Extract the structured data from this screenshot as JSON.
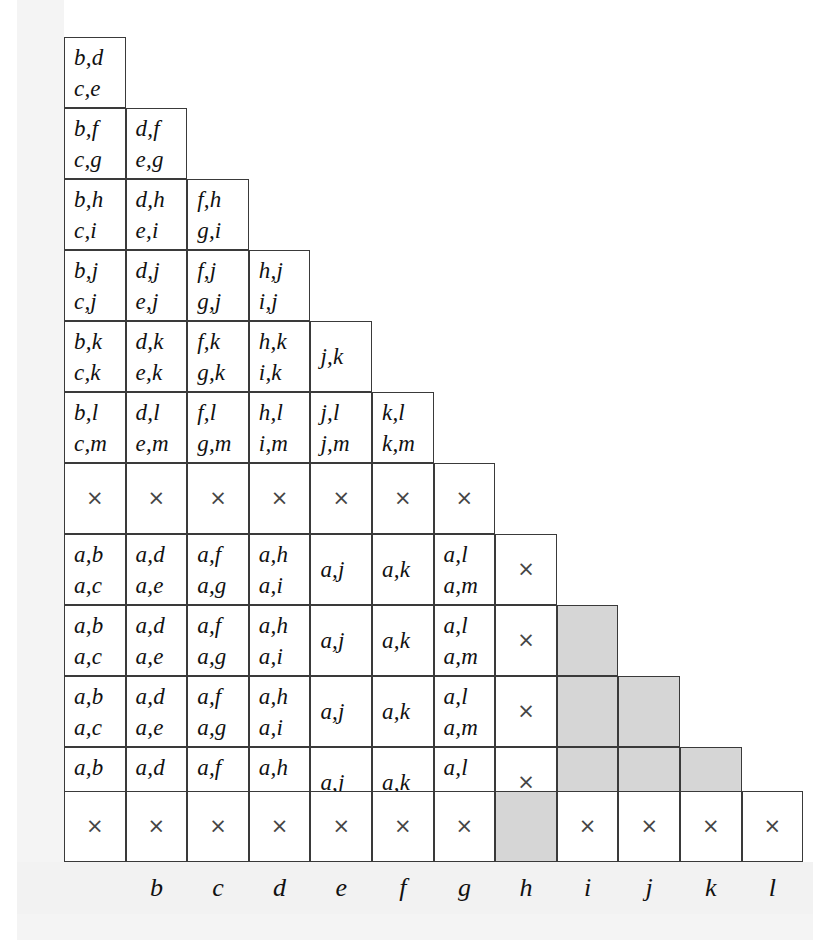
{
  "figure": {
    "grid_rows": 13,
    "grid_cols": 12,
    "cross_glyph": "×",
    "colors": {
      "cell_background": "#ffffff",
      "shaded_cell": "#d6d6d6",
      "grid_line": "#3a3a3a",
      "text": "#111111",
      "page_band": "#f2f2f2"
    }
  },
  "axis": {
    "name": "column-axis",
    "labels": [
      "",
      "b",
      "c",
      "d",
      "e",
      "f",
      "g",
      "h",
      "i",
      "j",
      "k",
      "l"
    ]
  },
  "chart_data": {
    "type": "table",
    "xlabel": "",
    "ylabel": "",
    "categories": [
      "",
      "b",
      "c",
      "d",
      "e",
      "f",
      "g",
      "h",
      "i",
      "j",
      "k",
      "l"
    ],
    "grid": [
      {
        "row": 1,
        "cells": [
          {
            "col": 1,
            "lines": [
              "b,d",
              "c,e"
            ],
            "shaded": false,
            "cross": false
          }
        ]
      },
      {
        "row": 2,
        "cells": [
          {
            "col": 1,
            "lines": [
              "b,f",
              "c,g"
            ],
            "shaded": false,
            "cross": false
          },
          {
            "col": 2,
            "lines": [
              "d,f",
              "e,g"
            ],
            "shaded": false,
            "cross": false
          }
        ]
      },
      {
        "row": 3,
        "cells": [
          {
            "col": 1,
            "lines": [
              "b,h",
              "c,i"
            ],
            "shaded": false,
            "cross": false
          },
          {
            "col": 2,
            "lines": [
              "d,h",
              "e,i"
            ],
            "shaded": false,
            "cross": false
          },
          {
            "col": 3,
            "lines": [
              "f,h",
              "g,i"
            ],
            "shaded": false,
            "cross": false
          }
        ]
      },
      {
        "row": 4,
        "cells": [
          {
            "col": 1,
            "lines": [
              "b,j",
              "c,j"
            ],
            "shaded": false,
            "cross": false
          },
          {
            "col": 2,
            "lines": [
              "d,j",
              "e,j"
            ],
            "shaded": false,
            "cross": false
          },
          {
            "col": 3,
            "lines": [
              "f,j",
              "g,j"
            ],
            "shaded": false,
            "cross": false
          },
          {
            "col": 4,
            "lines": [
              "h,j",
              "i,j"
            ],
            "shaded": false,
            "cross": false
          }
        ]
      },
      {
        "row": 5,
        "cells": [
          {
            "col": 1,
            "lines": [
              "b,k",
              "c,k"
            ],
            "shaded": false,
            "cross": false
          },
          {
            "col": 2,
            "lines": [
              "d,k",
              "e,k"
            ],
            "shaded": false,
            "cross": false
          },
          {
            "col": 3,
            "lines": [
              "f,k",
              "g,k"
            ],
            "shaded": false,
            "cross": false
          },
          {
            "col": 4,
            "lines": [
              "h,k",
              "i,k"
            ],
            "shaded": false,
            "cross": false
          },
          {
            "col": 5,
            "lines": [
              "j,k"
            ],
            "shaded": false,
            "cross": false
          }
        ]
      },
      {
        "row": 6,
        "cells": [
          {
            "col": 1,
            "lines": [
              "b,l",
              "c,m"
            ],
            "shaded": false,
            "cross": false
          },
          {
            "col": 2,
            "lines": [
              "d,l",
              "e,m"
            ],
            "shaded": false,
            "cross": false
          },
          {
            "col": 3,
            "lines": [
              "f,l",
              "g,m"
            ],
            "shaded": false,
            "cross": false
          },
          {
            "col": 4,
            "lines": [
              "h,l",
              "i,m"
            ],
            "shaded": false,
            "cross": false
          },
          {
            "col": 5,
            "lines": [
              "j,l",
              "j,m"
            ],
            "shaded": false,
            "cross": false
          },
          {
            "col": 6,
            "lines": [
              "k,l",
              "k,m"
            ],
            "shaded": false,
            "cross": false
          }
        ]
      },
      {
        "row": 7,
        "cells": [
          {
            "col": 1,
            "lines": [],
            "shaded": false,
            "cross": true
          },
          {
            "col": 2,
            "lines": [],
            "shaded": false,
            "cross": true
          },
          {
            "col": 3,
            "lines": [],
            "shaded": false,
            "cross": true
          },
          {
            "col": 4,
            "lines": [],
            "shaded": false,
            "cross": true
          },
          {
            "col": 5,
            "lines": [],
            "shaded": false,
            "cross": true
          },
          {
            "col": 6,
            "lines": [],
            "shaded": false,
            "cross": true
          },
          {
            "col": 7,
            "lines": [],
            "shaded": false,
            "cross": true
          }
        ]
      },
      {
        "row": 8,
        "cells": [
          {
            "col": 1,
            "lines": [
              "a,b",
              "a,c"
            ],
            "shaded": false,
            "cross": false
          },
          {
            "col": 2,
            "lines": [
              "a,d",
              "a,e"
            ],
            "shaded": false,
            "cross": false
          },
          {
            "col": 3,
            "lines": [
              "a,f",
              "a,g"
            ],
            "shaded": false,
            "cross": false
          },
          {
            "col": 4,
            "lines": [
              "a,h",
              "a,i"
            ],
            "shaded": false,
            "cross": false
          },
          {
            "col": 5,
            "lines": [
              "a,j"
            ],
            "shaded": false,
            "cross": false
          },
          {
            "col": 6,
            "lines": [
              "a,k"
            ],
            "shaded": false,
            "cross": false
          },
          {
            "col": 7,
            "lines": [
              "a,l",
              "a,m"
            ],
            "shaded": false,
            "cross": false
          },
          {
            "col": 8,
            "lines": [],
            "shaded": false,
            "cross": true
          }
        ]
      },
      {
        "row": 9,
        "cells": [
          {
            "col": 1,
            "lines": [
              "a,b",
              "a,c"
            ],
            "shaded": false,
            "cross": false
          },
          {
            "col": 2,
            "lines": [
              "a,d",
              "a,e"
            ],
            "shaded": false,
            "cross": false
          },
          {
            "col": 3,
            "lines": [
              "a,f",
              "a,g"
            ],
            "shaded": false,
            "cross": false
          },
          {
            "col": 4,
            "lines": [
              "a,h",
              "a,i"
            ],
            "shaded": false,
            "cross": false
          },
          {
            "col": 5,
            "lines": [
              "a,j"
            ],
            "shaded": false,
            "cross": false
          },
          {
            "col": 6,
            "lines": [
              "a,k"
            ],
            "shaded": false,
            "cross": false
          },
          {
            "col": 7,
            "lines": [
              "a,l",
              "a,m"
            ],
            "shaded": false,
            "cross": false
          },
          {
            "col": 8,
            "lines": [],
            "shaded": false,
            "cross": true
          },
          {
            "col": 9,
            "lines": [],
            "shaded": true,
            "cross": false
          }
        ]
      },
      {
        "row": 10,
        "cells": [
          {
            "col": 1,
            "lines": [
              "a,b",
              "a,c"
            ],
            "shaded": false,
            "cross": false
          },
          {
            "col": 2,
            "lines": [
              "a,d",
              "a,e"
            ],
            "shaded": false,
            "cross": false
          },
          {
            "col": 3,
            "lines": [
              "a,f",
              "a,g"
            ],
            "shaded": false,
            "cross": false
          },
          {
            "col": 4,
            "lines": [
              "a,h",
              "a,i"
            ],
            "shaded": false,
            "cross": false
          },
          {
            "col": 5,
            "lines": [
              "a,j"
            ],
            "shaded": false,
            "cross": false
          },
          {
            "col": 6,
            "lines": [
              "a,k"
            ],
            "shaded": false,
            "cross": false
          },
          {
            "col": 7,
            "lines": [
              "a,l",
              "a,m"
            ],
            "shaded": false,
            "cross": false
          },
          {
            "col": 8,
            "lines": [],
            "shaded": false,
            "cross": true
          },
          {
            "col": 9,
            "lines": [],
            "shaded": true,
            "cross": false
          },
          {
            "col": 10,
            "lines": [],
            "shaded": true,
            "cross": false
          }
        ]
      },
      {
        "row": 11,
        "cells": [
          {
            "col": 1,
            "lines": [
              "a,b",
              "a,c"
            ],
            "shaded": false,
            "cross": false
          },
          {
            "col": 2,
            "lines": [
              "a,d",
              "a,e"
            ],
            "shaded": false,
            "cross": false
          },
          {
            "col": 3,
            "lines": [
              "a,f",
              "a,g"
            ],
            "shaded": false,
            "cross": false
          },
          {
            "col": 4,
            "lines": [
              "a,h",
              "a,i"
            ],
            "shaded": false,
            "cross": false
          },
          {
            "col": 5,
            "lines": [
              "a,j"
            ],
            "shaded": false,
            "cross": false
          },
          {
            "col": 6,
            "lines": [
              "a,k"
            ],
            "shaded": false,
            "cross": false
          },
          {
            "col": 7,
            "lines": [
              "a,l",
              "a,m"
            ],
            "shaded": false,
            "cross": false
          },
          {
            "col": 8,
            "lines": [],
            "shaded": false,
            "cross": true
          },
          {
            "col": 9,
            "lines": [],
            "shaded": true,
            "cross": false
          },
          {
            "col": 10,
            "lines": [],
            "shaded": true,
            "cross": false
          },
          {
            "col": 11,
            "lines": [],
            "shaded": true,
            "cross": false
          }
        ]
      },
      {
        "row": 12,
        "cells": [
          {
            "col": 1,
            "lines": [],
            "shaded": false,
            "cross": true
          },
          {
            "col": 2,
            "lines": [],
            "shaded": false,
            "cross": true
          },
          {
            "col": 3,
            "lines": [],
            "shaded": false,
            "cross": true
          },
          {
            "col": 4,
            "lines": [],
            "shaded": false,
            "cross": true
          },
          {
            "col": 5,
            "lines": [],
            "shaded": false,
            "cross": true
          },
          {
            "col": 6,
            "lines": [],
            "shaded": false,
            "cross": true
          },
          {
            "col": 7,
            "lines": [],
            "shaded": false,
            "cross": true
          },
          {
            "col": 8,
            "lines": [],
            "shaded": true,
            "cross": false
          },
          {
            "col": 9,
            "lines": [],
            "shaded": false,
            "cross": true
          },
          {
            "col": 10,
            "lines": [],
            "shaded": false,
            "cross": true
          },
          {
            "col": 11,
            "lines": [],
            "shaded": false,
            "cross": true
          },
          {
            "col": 12,
            "lines": [],
            "shaded": false,
            "cross": true
          }
        ]
      }
    ]
  },
  "geometry": {
    "origin_x": 64,
    "origin_y": 37,
    "col_width": 61.6,
    "row_height": 71,
    "short_row_height": 64,
    "bottom_row_top": 791,
    "bottom_row_height": 71
  }
}
